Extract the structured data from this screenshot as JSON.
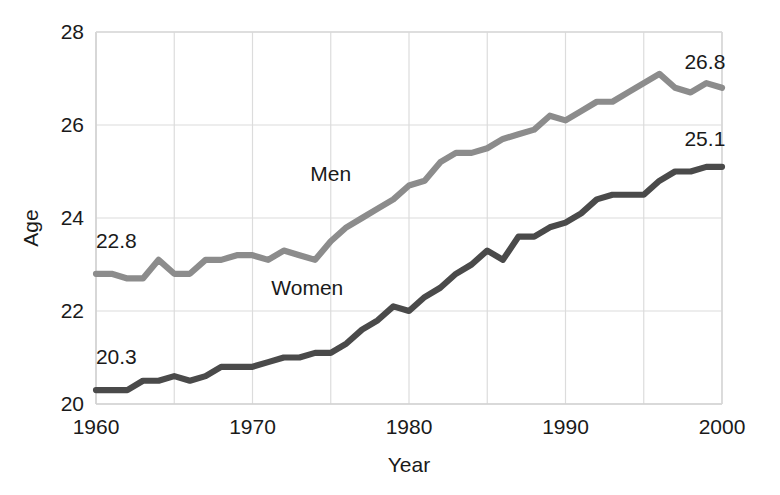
{
  "chart_data": {
    "type": "line",
    "title": "",
    "xlabel": "Year",
    "ylabel": "Age",
    "xlim": [
      1960,
      2000
    ],
    "ylim": [
      20,
      28
    ],
    "xticks": [
      1960,
      1970,
      1980,
      1990,
      2000
    ],
    "xtick_labels": [
      "1960",
      "1970",
      "1980",
      "1990",
      "2000"
    ],
    "yticks": [
      20,
      22,
      24,
      26,
      28
    ],
    "ytick_labels": [
      "20",
      "22",
      "24",
      "26",
      "28"
    ],
    "grid": true,
    "grid_x_step": 5,
    "grid_y_step": 2,
    "legend": "inline-labels",
    "x": [
      1960,
      1961,
      1962,
      1963,
      1964,
      1965,
      1966,
      1967,
      1968,
      1969,
      1970,
      1971,
      1972,
      1973,
      1974,
      1975,
      1976,
      1977,
      1978,
      1979,
      1980,
      1981,
      1982,
      1983,
      1984,
      1985,
      1986,
      1987,
      1988,
      1989,
      1990,
      1991,
      1992,
      1993,
      1994,
      1995,
      1996,
      1997,
      1998,
      1999,
      2000
    ],
    "series": [
      {
        "name": "Men",
        "color": "#8c8c8c",
        "label_x": 1975,
        "label_y": 24.8,
        "start_label": "22.8",
        "end_label": "26.8",
        "values": [
          22.8,
          22.8,
          22.7,
          22.7,
          23.1,
          22.8,
          22.8,
          23.1,
          23.1,
          23.2,
          23.2,
          23.1,
          23.3,
          23.2,
          23.1,
          23.5,
          23.8,
          24.0,
          24.2,
          24.4,
          24.7,
          24.8,
          25.2,
          25.4,
          25.4,
          25.5,
          25.7,
          25.8,
          25.9,
          26.2,
          26.1,
          26.3,
          26.5,
          26.5,
          26.7,
          26.9,
          27.1,
          26.8,
          26.7,
          26.9,
          26.8
        ]
      },
      {
        "name": "Women",
        "color": "#4a4a4a",
        "label_x": 1973.5,
        "label_y": 22.35,
        "start_label": "20.3",
        "end_label": "25.1",
        "values": [
          20.3,
          20.3,
          20.3,
          20.5,
          20.5,
          20.6,
          20.5,
          20.6,
          20.8,
          20.8,
          20.8,
          20.9,
          21.0,
          21.0,
          21.1,
          21.1,
          21.3,
          21.6,
          21.8,
          22.1,
          22.0,
          22.3,
          22.5,
          22.8,
          23.0,
          23.3,
          23.1,
          23.6,
          23.6,
          23.8,
          23.9,
          24.1,
          24.4,
          24.5,
          24.5,
          24.5,
          24.8,
          25.0,
          25.0,
          25.1,
          25.1
        ]
      }
    ],
    "annotations": [
      {
        "text": "22.8",
        "x": 1961.3,
        "y": 23.35,
        "series": "Men",
        "position": "above-left"
      },
      {
        "text": "26.8",
        "x": 1997.6,
        "y": 27.2,
        "series": "Men",
        "position": "above-right"
      },
      {
        "text": "20.3",
        "x": 1961.3,
        "y": 20.85,
        "series": "Women",
        "position": "above-left"
      },
      {
        "text": "25.1",
        "x": 1997.6,
        "y": 25.55,
        "series": "Women",
        "position": "above-right"
      }
    ]
  },
  "axes": {
    "y_axis_title": "Age",
    "x_axis_title": "Year"
  },
  "colors": {
    "men_line": "#8c8c8c",
    "women_line": "#4a4a4a",
    "grid": "#dcdcdc",
    "text": "#1a1a1a",
    "background": "#ffffff"
  }
}
